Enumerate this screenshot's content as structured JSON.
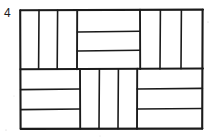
{
  "figure": {
    "label": "4",
    "type": "basketweave-parquet-diagram",
    "ink_color": "#1b1b1b",
    "background_color": "#ffffff",
    "outer_rect": {
      "x": 20,
      "y": 10,
      "width": 183,
      "height": 119
    },
    "grid": {
      "rows": 2,
      "cols": 3
    },
    "blocks": [
      {
        "name": "top-left-block",
        "row": 0,
        "col": 0,
        "orientation": "vertical",
        "bar_count": 3,
        "x": 20,
        "y": 10,
        "width": 57,
        "height": 59
      },
      {
        "name": "top-middle-block",
        "row": 0,
        "col": 1,
        "orientation": "horizontal",
        "bar_count": 3,
        "x": 77,
        "y": 10,
        "width": 63,
        "height": 59
      },
      {
        "name": "top-right-block",
        "row": 0,
        "col": 2,
        "orientation": "vertical",
        "bar_count": 3,
        "x": 140,
        "y": 10,
        "width": 63,
        "height": 59
      },
      {
        "name": "bottom-left-block",
        "row": 1,
        "col": 0,
        "orientation": "horizontal",
        "bar_count": 3,
        "x": 20,
        "y": 69,
        "width": 60,
        "height": 60
      },
      {
        "name": "bottom-middle-block",
        "row": 1,
        "col": 1,
        "orientation": "vertical",
        "bar_count": 3,
        "x": 80,
        "y": 69,
        "width": 57,
        "height": 60
      },
      {
        "name": "bottom-right-block",
        "row": 1,
        "col": 2,
        "orientation": "horizontal",
        "bar_count": 3,
        "x": 137,
        "y": 69,
        "width": 66,
        "height": 60
      }
    ]
  }
}
